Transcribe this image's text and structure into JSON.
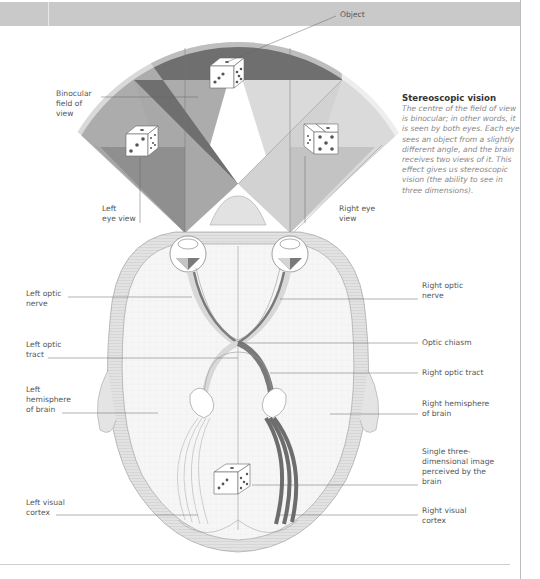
{
  "sidebar": {
    "title": "Stereoscopic vision",
    "body": "The centre of the field of view is binocular; in other words, it is seen by both eyes. Each eye sees an object from a slightly different angle, and the brain receives two views of it. This effect gives us stereoscopic vision (the ability to see in three dimensions)."
  },
  "labels": {
    "object": "Object",
    "binocular_field": "Binocular\nfield of\nview",
    "left_eye_view": "Left\neye view",
    "right_eye_view": "Right eye\nview",
    "left_optic_nerve": "Left optic\nnerve",
    "right_optic_nerve": "Right optic\nnerve",
    "optic_chiasm": "Optic chiasm",
    "left_optic_tract": "Left optic\ntract",
    "right_optic_tract": "Right optic tract",
    "left_hemisphere": "Left\nhemisphere\nof brain",
    "right_hemisphere": "Right hemisphere\nof brain",
    "single_image": "Single three-\ndimensional image\nperceived by the\nbrain",
    "left_visual_cortex": "Left visual\ncortex",
    "right_visual_cortex": "Right visual\ncortex"
  },
  "colors": {
    "header": "#c9c9c9",
    "binocular_dark": "#6e6e6e",
    "monocular_mid": "#a9a9a9",
    "monocular_light": "#d6d6d6",
    "brain_fill": "#f4f4f4",
    "outline": "#8a8a8a"
  }
}
